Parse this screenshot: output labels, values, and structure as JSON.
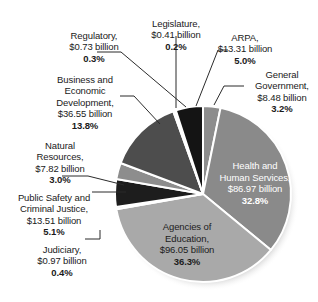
{
  "chart_data": {
    "type": "pie",
    "title": "",
    "xlabel": "",
    "ylabel": "",
    "legend_position": "none",
    "grid": false,
    "units": "billion dollars",
    "categories": [
      "General Government",
      "Health and Human Services",
      "Agencies of Education",
      "Judiciary",
      "Public Safety and Criminal Justice",
      "Natural Resources",
      "Business and Economic Development",
      "Regulatory",
      "Legislature",
      "ARPA"
    ],
    "values": [
      8.48,
      86.97,
      96.05,
      0.97,
      13.51,
      7.82,
      36.55,
      0.73,
      0.41,
      13.31
    ],
    "percentages": [
      3.2,
      32.8,
      36.3,
      0.4,
      5.1,
      3.0,
      13.8,
      0.3,
      0.2,
      5.0
    ],
    "slices": [
      {
        "name": "General Government",
        "amount": "$8.48 billion",
        "value": 8.48,
        "percent": 3.2,
        "percent_label": "3.2%",
        "color": "#8d8d8d",
        "label_placement": "callout"
      },
      {
        "name": "Health and Human Services",
        "amount": "$86.97 billion",
        "value": 86.97,
        "percent": 32.8,
        "percent_label": "32.8%",
        "color": "#8a8a8a",
        "label_placement": "inside"
      },
      {
        "name": "Agencies of Education",
        "amount": "$96.05 billion",
        "value": 96.05,
        "percent": 36.3,
        "percent_label": "36.3%",
        "color": "#a9a9a9",
        "label_placement": "inside"
      },
      {
        "name": "Judiciary",
        "amount": "$0.97 billion",
        "value": 0.97,
        "percent": 0.4,
        "percent_label": "0.4%",
        "color": "#b4b4b4",
        "label_placement": "callout"
      },
      {
        "name": "Public Safety and Criminal Justice",
        "amount": "$13.51 billion",
        "value": 13.51,
        "percent": 5.1,
        "percent_label": "5.1%",
        "color": "#1d1d1d",
        "label_placement": "callout"
      },
      {
        "name": "Natural Resources",
        "amount": "$7.82 billion",
        "value": 7.82,
        "percent": 3.0,
        "percent_label": "3.0%",
        "color": "#8d8d8d",
        "label_placement": "callout"
      },
      {
        "name": "Business and Economic Development",
        "amount": "$36.55 billion",
        "value": 36.55,
        "percent": 13.8,
        "percent_label": "13.8%",
        "color": "#4d4d4d",
        "label_placement": "callout"
      },
      {
        "name": "Regulatory",
        "amount": "$0.73 billion",
        "value": 0.73,
        "percent": 0.3,
        "percent_label": "0.3%",
        "color": "#6e6e6e",
        "label_placement": "callout"
      },
      {
        "name": "Legislature",
        "amount": "$0.41 billion",
        "value": 0.41,
        "percent": 0.2,
        "percent_label": "0.2%",
        "color": "#9b9b9b",
        "label_placement": "callout"
      },
      {
        "name": "ARPA",
        "amount": "$13.31 billion",
        "value": 13.31,
        "percent": 5.0,
        "percent_label": "5.0%",
        "color": "#141414",
        "label_placement": "callout"
      }
    ]
  },
  "callouts": {
    "regulatory": {
      "text": "Regulatory,\n$0.73 billion",
      "pct": "0.3%"
    },
    "legislature": {
      "text": "Legislature,\n$0.41 billion",
      "pct": "0.2%"
    },
    "arpa": {
      "text": "ARPA,\n$13.31 billion",
      "pct": "5.0%"
    },
    "general_government": {
      "text": "General\nGovernment,\n$8.48 billion",
      "pct": "3.2%"
    },
    "business": {
      "text": "Business and\nEconomic\nDevelopment,\n$36.55 billion",
      "pct": "13.8%"
    },
    "natural_resources": {
      "text": "Natural\nResources,\n$7.82 billion",
      "pct": "3.0%"
    },
    "public_safety": {
      "text": "Public Safety and\nCriminal Justice,\n$13.51 billion",
      "pct": "5.1%"
    },
    "judiciary": {
      "text": "Judiciary,\n$0.97 billion",
      "pct": "0.4%"
    }
  },
  "inner_labels": {
    "health_human_services": {
      "text": "Health and\nHuman Services,\n$86.97 billion",
      "pct": "32.8%"
    },
    "agencies_of_education": {
      "text": "Agencies of\nEducation,\n$96.05 billion",
      "pct": "36.3%"
    }
  },
  "style": {
    "background": "#ffffff",
    "slice_separator": "#ffffff",
    "leader_line": "#2b2b2b",
    "text_dark": "#1a1a1a",
    "text_light": "#ffffff"
  }
}
